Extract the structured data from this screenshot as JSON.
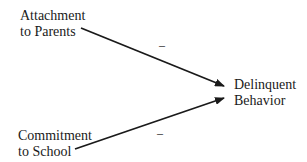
{
  "nodes": {
    "attachment": {
      "line1": "Attachment",
      "line2": "to Parents"
    },
    "commitment": {
      "line1": "Commitment",
      "line2": "to School"
    },
    "delinquent": {
      "line1": "Delinquent",
      "line2": "Behavior"
    }
  },
  "edges": [
    {
      "from": "attachment",
      "to": "delinquent",
      "sign": "–"
    },
    {
      "from": "commitment",
      "to": "delinquent",
      "sign": "–"
    }
  ]
}
